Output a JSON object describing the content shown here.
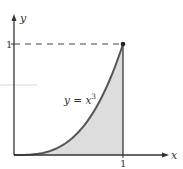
{
  "chart_data": {
    "type": "area",
    "title": "",
    "xlabel": "x",
    "ylabel": "y",
    "function": "y = x^3",
    "curve_label": "y = x",
    "curve_label_exponent": "3",
    "x_ticks": [
      "1"
    ],
    "y_ticks": [
      "1"
    ],
    "xlim": [
      0,
      1.4
    ],
    "ylim": [
      0,
      1.4
    ],
    "x": [
      0,
      0.1,
      0.2,
      0.3,
      0.4,
      0.5,
      0.6,
      0.7,
      0.8,
      0.9,
      1.0
    ],
    "values": [
      0,
      0.001,
      0.008,
      0.027,
      0.064,
      0.125,
      0.216,
      0.343,
      0.512,
      0.729,
      1.0
    ],
    "shaded_region": "area under y = x^3 from x = 0 to x = 1",
    "marked_point": [
      1,
      1
    ],
    "dashed_guide": "horizontal from (0,1) to (1,1)",
    "vertical_line": "x = 1 from y = 0 to y = 1",
    "grid": false,
    "legend": "none"
  },
  "colors": {
    "axis": "#333333",
    "curve": "#555555",
    "fill": "#dddddd",
    "dash": "#444444",
    "artifact": "#e4e4e4"
  }
}
